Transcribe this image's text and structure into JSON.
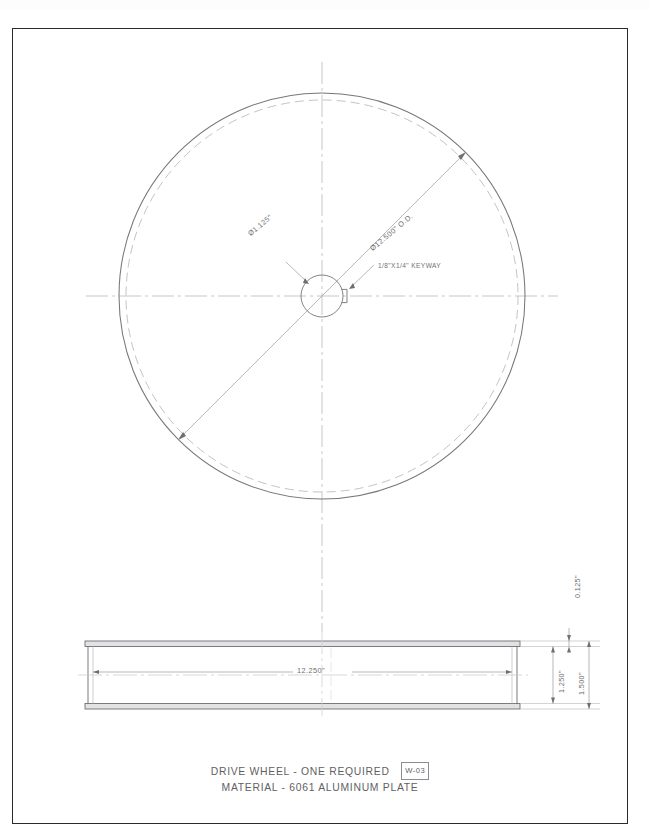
{
  "sheet": {
    "width": 650,
    "height": 838,
    "background_color": "#ffffff",
    "border_color": "#2b2b2b",
    "line_color": "#6f6f72",
    "text_color": "#5f5f63"
  },
  "top_view": {
    "name": "wheel-plan-view",
    "center_x": 322,
    "center_y": 296,
    "outer_radius": 203,
    "inner_dashed_radius": 196,
    "bore_radius": 21,
    "callouts": {
      "bore_diameter": "Ø1.125\"",
      "outside_diameter": "Ø12.500\" O.D.",
      "keyway": "1/8\"X1/4\" KEYWAY"
    }
  },
  "side_view": {
    "name": "wheel-section-view",
    "left": 85,
    "right": 520,
    "top": 641,
    "bottom": 709,
    "dimensions": {
      "width": "12.250\"",
      "flange_thickness": "0.125\"",
      "web_height": "1.250\"",
      "overall_height": "1.500\""
    }
  },
  "title_block": {
    "line_1": "DRIVE WHEEL - ONE REQUIRED",
    "part_tag": "W-03",
    "line_2": "MATERIAL - 6061  ALUMINUM PLATE"
  }
}
